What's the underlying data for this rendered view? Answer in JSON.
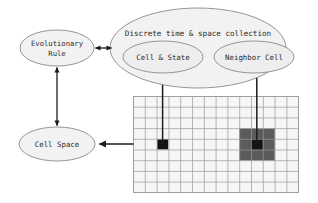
{
  "diagram": {
    "title_node": {
      "label": "Discrete time & space collection"
    },
    "nodes": [
      {
        "id": "evolutionary-rule",
        "label_line1": "Evolutionary",
        "label_line2": "Rule",
        "shape": "ellipse"
      },
      {
        "id": "cell-space",
        "label": "Cell Space",
        "shape": "ellipse"
      },
      {
        "id": "discrete-collection",
        "label": "Discrete time & space collection",
        "shape": "ellipse"
      },
      {
        "id": "cell-and-state",
        "label": "Cell & State",
        "shape": "ellipse"
      },
      {
        "id": "neighbor-cell",
        "label": "Neighbor Cell",
        "shape": "ellipse"
      }
    ],
    "edges": [
      {
        "id": "rule-to-collection",
        "from": "evolutionary-rule",
        "to": "discrete-collection",
        "arrow": "double",
        "orientation": "horizontal"
      },
      {
        "id": "rule-to-cellspace",
        "from": "evolutionary-rule",
        "to": "cell-space",
        "arrow": "double",
        "orientation": "vertical"
      },
      {
        "id": "grid-to-cellspace",
        "from": "cell-grid",
        "to": "cell-space",
        "arrow": "single",
        "orientation": "horizontal"
      },
      {
        "id": "grid-cell-to-cellstate",
        "from": "cell-grid-black-cell",
        "to": "cell-and-state",
        "arrow": "single",
        "orientation": "vertical"
      },
      {
        "id": "grid-neighborhood-to-neighborcell",
        "from": "cell-grid-neighborhood",
        "to": "neighbor-cell",
        "arrow": "single",
        "orientation": "vertical"
      }
    ],
    "grid": {
      "label": "cell-grid",
      "columns": 14,
      "rows": 9,
      "cell_fill": "#f6f6f6",
      "line_color": "#9a9a9a",
      "highlighted_cell": {
        "name": "active-cell",
        "col": 2,
        "row": 4,
        "color": "#141414"
      },
      "neighborhood": {
        "name": "neighborhood-block",
        "col": 9,
        "row": 3,
        "width": 3,
        "height": 3,
        "color": "#5b5b5b"
      },
      "neighborhood_center": {
        "name": "neighborhood-center-cell",
        "col": 10,
        "row": 4,
        "color": "#141414"
      }
    },
    "colors": {
      "ellipse_fill": "#f2f2f2",
      "ellipse_stroke": "#8a8a8a",
      "arrow": "#1c1c1c",
      "text": "#2b2b2b"
    }
  }
}
